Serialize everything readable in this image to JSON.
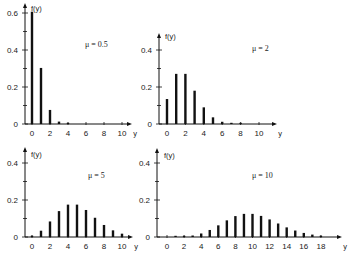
{
  "chart_data": [
    {
      "type": "bar",
      "title": "μ = 0.5",
      "xlabel": "y",
      "ylabel": "f(y)",
      "categories": [
        0,
        1,
        2,
        3,
        4,
        5,
        6,
        7,
        8,
        9,
        10
      ],
      "values": [
        0.607,
        0.303,
        0.076,
        0.013,
        0.002,
        0,
        0,
        0,
        0,
        0,
        0
      ],
      "xticks": [
        "0",
        "2",
        "4",
        "6",
        "8",
        "10"
      ],
      "yticks": [
        "0",
        "0.2",
        "0.4",
        "0.6"
      ],
      "ylim": [
        0,
        0.65
      ],
      "xlim": [
        0,
        11
      ],
      "grid": false
    },
    {
      "type": "bar",
      "title": "μ = 2",
      "xlabel": "y",
      "ylabel": "f(y)",
      "categories": [
        0,
        1,
        2,
        3,
        4,
        5,
        6,
        7,
        8,
        9,
        10
      ],
      "values": [
        0.135,
        0.271,
        0.271,
        0.18,
        0.09,
        0.036,
        0.012,
        0.003,
        0.001,
        0,
        0
      ],
      "xticks": [
        "0",
        "2",
        "4",
        "6",
        "8",
        "10"
      ],
      "yticks": [
        "0",
        "0.2",
        "0.4"
      ],
      "ylim": [
        0,
        0.45
      ],
      "xlim": [
        0,
        11
      ],
      "grid": false
    },
    {
      "type": "bar",
      "title": "μ = 5",
      "xlabel": "y",
      "ylabel": "f(y)",
      "categories": [
        0,
        1,
        2,
        3,
        4,
        5,
        6,
        7,
        8,
        9,
        10
      ],
      "values": [
        0.007,
        0.034,
        0.084,
        0.14,
        0.175,
        0.175,
        0.146,
        0.104,
        0.065,
        0.036,
        0.018
      ],
      "xticks": [
        "0",
        "2",
        "4",
        "6",
        "8",
        "10"
      ],
      "yticks": [
        "0",
        "0.2",
        "0.4"
      ],
      "ylim": [
        0,
        0.45
      ],
      "xlim": [
        0,
        11
      ],
      "grid": false
    },
    {
      "type": "bar",
      "title": "μ = 10",
      "xlabel": "y",
      "ylabel": "f(y)",
      "categories": [
        0,
        1,
        2,
        3,
        4,
        5,
        6,
        7,
        8,
        9,
        10,
        11,
        12,
        13,
        14,
        15,
        16,
        17,
        18
      ],
      "values": [
        0,
        0.0005,
        0.002,
        0.008,
        0.019,
        0.038,
        0.063,
        0.09,
        0.113,
        0.125,
        0.125,
        0.114,
        0.095,
        0.073,
        0.052,
        0.035,
        0.022,
        0.013,
        0.007
      ],
      "xticks": [
        "0",
        "2",
        "4",
        "6",
        "8",
        "10",
        "12",
        "14",
        "16",
        "18"
      ],
      "yticks": [
        "0",
        "0.2",
        "0.4"
      ],
      "ylim": [
        0,
        0.45
      ],
      "xlim": [
        0,
        19
      ],
      "grid": false
    }
  ],
  "panels": [
    {
      "mu_label": "μ = 0.5",
      "ylabel": "f(y)",
      "xlabel": "y"
    },
    {
      "mu_label": "μ = 2",
      "ylabel": "f(y)",
      "xlabel": "y"
    },
    {
      "mu_label": "μ = 5",
      "ylabel": "f(y)",
      "xlabel": "y"
    },
    {
      "mu_label": "μ = 10",
      "ylabel": "f(y)",
      "xlabel": "y"
    }
  ]
}
